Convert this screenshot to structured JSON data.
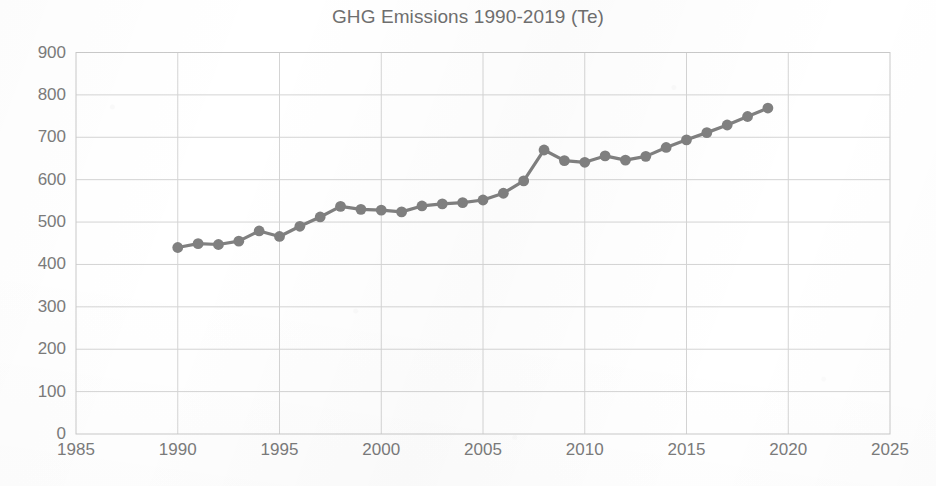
{
  "chart_data": {
    "type": "line",
    "title": "GHG Emissions 1990-2019 (Te)",
    "xlabel": "",
    "ylabel": "",
    "xlim": [
      1985,
      2025
    ],
    "ylim": [
      0,
      900
    ],
    "xticks": [
      1985,
      1990,
      1995,
      2000,
      2005,
      2010,
      2015,
      2020,
      2025
    ],
    "yticks": [
      0,
      100,
      200,
      300,
      400,
      500,
      600,
      700,
      800,
      900
    ],
    "grid": true,
    "legend": "none",
    "marker": "circle",
    "series_color": "#808080",
    "x": [
      1990,
      1991,
      1992,
      1993,
      1994,
      1995,
      1996,
      1997,
      1998,
      1999,
      2000,
      2001,
      2002,
      2003,
      2004,
      2005,
      2006,
      2007,
      2008,
      2009,
      2010,
      2011,
      2012,
      2013,
      2014,
      2015,
      2016,
      2017,
      2018,
      2019
    ],
    "series": [
      {
        "name": "GHG Emissions (Te)",
        "values": [
          440,
          449,
          447,
          455,
          479,
          466,
          490,
          512,
          537,
          530,
          528,
          524,
          538,
          543,
          546,
          552,
          568,
          597,
          670,
          645,
          641,
          656,
          646,
          655,
          676,
          694,
          711,
          729,
          749,
          769
        ]
      }
    ]
  },
  "axes": {
    "y_tick_labels": [
      "900",
      "800",
      "700",
      "600",
      "500",
      "400",
      "300",
      "200",
      "100",
      "0"
    ],
    "x_tick_labels": [
      "1985",
      "1990",
      "1995",
      "2000",
      "2005",
      "2010",
      "2015",
      "2020",
      "2025"
    ]
  }
}
